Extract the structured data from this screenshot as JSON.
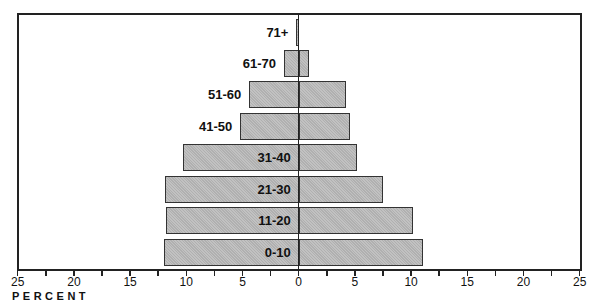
{
  "chart_data": {
    "type": "bar",
    "subtype": "population-pyramid",
    "title": "",
    "xlabel": "PERCENT",
    "ylabel": "",
    "xlim": [
      -25,
      25
    ],
    "x_ticks": [
      25,
      20,
      15,
      10,
      5,
      0,
      5,
      10,
      15,
      20,
      25
    ],
    "minor_tick_step": 2.5,
    "grid": false,
    "legend": null,
    "categories": [
      "71+",
      "61-70",
      "51-60",
      "41-50",
      "31-40",
      "21-30",
      "11-20",
      "0-10"
    ],
    "series": [
      {
        "name": "left",
        "values": [
          0.2,
          1.3,
          4.4,
          5.2,
          10.3,
          11.9,
          11.8,
          12.0
        ]
      },
      {
        "name": "right",
        "values": [
          0.0,
          0.9,
          4.2,
          4.6,
          5.2,
          7.5,
          10.2,
          11.1
        ]
      }
    ],
    "colors": {
      "bar_fill": "#b9b9b9",
      "bar_border": "#333333",
      "axis": "#222222"
    }
  }
}
